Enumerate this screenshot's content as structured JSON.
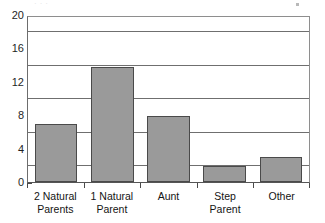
{
  "chart_data": {
    "type": "bar",
    "title": "",
    "subtitle": "",
    "xlabel": "",
    "ylabel": "",
    "categories": [
      "2 Natural Parents",
      "1 Natural Parent",
      "Aunt",
      "Step Parent",
      "Other"
    ],
    "category_lines": [
      [
        "2 Natural",
        "Parents"
      ],
      [
        "1 Natural",
        "Parent"
      ],
      [
        "Aunt"
      ],
      [
        "Step",
        "Parent"
      ],
      [
        "Other"
      ]
    ],
    "values": [
      7,
      14,
      8,
      2,
      3
    ],
    "ylim": [
      0,
      20
    ],
    "ytick_labels": [
      "0",
      "4",
      "8",
      "12",
      "16",
      "20"
    ],
    "ytick_values": [
      0,
      4,
      8,
      12,
      16,
      20
    ],
    "grid": true,
    "grid_axis": "y",
    "legend": false,
    "legend_position": "none",
    "orientation": "vertical"
  },
  "style": {
    "bar_fill": "#9a9a9a",
    "bar_border": "#4a4a4a",
    "grid_color": "#6f6f6f",
    "axis_color": "#555555",
    "text_color": "#141414",
    "background": "#ffffff"
  },
  "artifacts": {
    "top_cut_text": "· · ·"
  }
}
